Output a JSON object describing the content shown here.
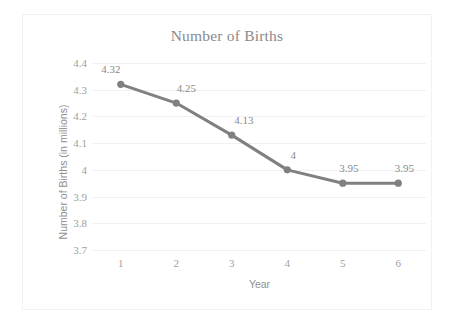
{
  "chart_data": {
    "type": "line",
    "title": "Number of Births",
    "xlabel": "Year",
    "ylabel": "Number of Births (in millions)",
    "categories": [
      1,
      2,
      3,
      4,
      5,
      6
    ],
    "x_ticks": [
      "1",
      "2",
      "3",
      "4",
      "5",
      "6"
    ],
    "values": [
      4.32,
      4.25,
      4.13,
      4,
      3.95,
      3.95
    ],
    "point_labels": [
      "4.32",
      "4.25",
      "4.13",
      "4",
      "3.95",
      "3.95"
    ],
    "y_ticks": [
      "4.4",
      "4.3",
      "4.2",
      "4.1",
      "4",
      "3.9",
      "3.8",
      "3.7"
    ],
    "y_tick_values": [
      4.4,
      4.3,
      4.2,
      4.1,
      4.0,
      3.9,
      3.8,
      3.7
    ],
    "ylim": [
      3.7,
      4.4
    ],
    "xlim": [
      0.5,
      6.5
    ],
    "grid": "horizontal",
    "legend": "none",
    "series_color": "#808080",
    "marker_color": "#808080",
    "gridline_color": "#f0f0f0",
    "text_color": "#8a8a8a",
    "border_color": "#f2f2f2",
    "background_color": "#ffffff"
  }
}
